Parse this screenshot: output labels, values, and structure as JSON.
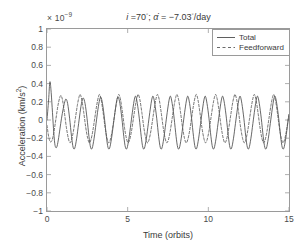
{
  "figure": {
    "exponent_prefix": "× 10",
    "exponent_power": "−9",
    "title_inclination": "i",
    "title_eq1": " =70",
    "title_deg1": "◦",
    "title_sep": "; ",
    "title_alpha": "α̇",
    "title_eq2": " = −7.03",
    "title_deg2": "◦",
    "title_unit": "/day",
    "title_full": "i =70°; α̇ = −7.03°/day"
  },
  "legend": {
    "position": "top-right",
    "items": [
      {
        "label": "Total",
        "style": "solid",
        "color": "#4d4d4d"
      },
      {
        "label": "Feedforward",
        "style": "dashed",
        "color": "#5a5a5a"
      }
    ]
  },
  "chart_data": {
    "type": "line",
    "xlabel": "Time (orbits)",
    "ylabel": "Acceleration (km/s²)",
    "y_exponent": -9,
    "xlim": [
      0,
      15
    ],
    "ylim": [
      -1,
      1
    ],
    "xticks": [
      0,
      5,
      10,
      15
    ],
    "yticks": [
      1,
      0.8,
      0.6,
      0.4,
      0.2,
      0,
      -0.2,
      -0.4,
      -0.6,
      -0.8,
      -1
    ],
    "xticklabels": [
      "0",
      "5",
      "10",
      "15"
    ],
    "yticklabels": [
      "1",
      "0.8",
      "0.6",
      "0.4",
      "0.2",
      "0",
      "−0.2",
      "−0.4",
      "−0.6",
      "−0.8",
      "−1"
    ],
    "grid": false,
    "series": [
      {
        "name": "Total",
        "style": "solid",
        "color": "#4d4d4d",
        "description": "Oscillatory acceleration, one cycle per orbit, initial peak 0.42e-9 decaying to steady amplitude of about 0.25e-9, slight positive-negative asymmetry",
        "period_orbits": 1.0,
        "initial_peak": 0.42,
        "steady_peak": 0.26,
        "steady_trough": -0.3,
        "points": [
          [
            0.0,
            0.0
          ],
          [
            0.1,
            0.22
          ],
          [
            0.18,
            0.42
          ],
          [
            0.26,
            0.3
          ],
          [
            0.34,
            0.08
          ],
          [
            0.42,
            -0.14
          ],
          [
            0.5,
            -0.28
          ],
          [
            0.6,
            -0.3
          ],
          [
            0.7,
            -0.22
          ],
          [
            0.8,
            -0.1
          ],
          [
            0.9,
            0.02
          ],
          [
            1.0,
            0.12
          ],
          [
            1.1,
            0.2
          ],
          [
            1.18,
            0.23
          ],
          [
            1.28,
            0.18
          ],
          [
            1.4,
            0.02
          ],
          [
            1.52,
            -0.18
          ],
          [
            1.62,
            -0.3
          ],
          [
            1.72,
            -0.31
          ],
          [
            1.84,
            -0.2
          ],
          [
            1.96,
            -0.04
          ],
          [
            2.08,
            0.12
          ],
          [
            2.18,
            0.22
          ],
          [
            2.26,
            0.24
          ],
          [
            2.36,
            0.18
          ],
          [
            2.48,
            0.02
          ],
          [
            2.6,
            -0.18
          ],
          [
            2.7,
            -0.3
          ],
          [
            2.8,
            -0.31
          ],
          [
            2.92,
            -0.2
          ],
          [
            3.04,
            -0.04
          ],
          [
            3.16,
            0.12
          ],
          [
            3.26,
            0.22
          ],
          [
            3.34,
            0.25
          ],
          [
            3.44,
            0.18
          ],
          [
            3.56,
            0.02
          ],
          [
            3.68,
            -0.18
          ],
          [
            3.78,
            -0.3
          ],
          [
            3.88,
            -0.31
          ],
          [
            4.0,
            -0.2
          ],
          [
            4.12,
            -0.04
          ],
          [
            4.24,
            0.12
          ],
          [
            4.34,
            0.23
          ],
          [
            4.42,
            0.25
          ],
          [
            4.52,
            0.18
          ],
          [
            4.64,
            0.02
          ],
          [
            4.76,
            -0.18
          ],
          [
            4.86,
            -0.3
          ],
          [
            4.96,
            -0.31
          ],
          [
            5.08,
            -0.2
          ],
          [
            5.2,
            -0.04
          ],
          [
            5.32,
            0.12
          ],
          [
            5.42,
            0.23
          ],
          [
            5.5,
            0.26
          ],
          [
            5.6,
            0.18
          ],
          [
            5.72,
            0.02
          ],
          [
            5.84,
            -0.18
          ],
          [
            5.94,
            -0.3
          ],
          [
            6.04,
            -0.31
          ],
          [
            6.16,
            -0.2
          ],
          [
            6.28,
            -0.04
          ],
          [
            6.4,
            0.12
          ],
          [
            6.5,
            0.23
          ],
          [
            6.58,
            0.26
          ],
          [
            6.68,
            0.18
          ],
          [
            6.8,
            0.02
          ],
          [
            6.92,
            -0.18
          ],
          [
            7.02,
            -0.3
          ],
          [
            7.12,
            -0.31
          ],
          [
            7.24,
            -0.2
          ],
          [
            7.36,
            -0.04
          ],
          [
            7.48,
            0.12
          ],
          [
            7.58,
            0.23
          ],
          [
            7.66,
            0.26
          ],
          [
            7.76,
            0.18
          ],
          [
            7.88,
            0.02
          ],
          [
            8.0,
            -0.18
          ],
          [
            8.1,
            -0.3
          ],
          [
            8.2,
            -0.31
          ],
          [
            8.32,
            -0.2
          ],
          [
            8.44,
            -0.04
          ],
          [
            8.56,
            0.12
          ],
          [
            8.66,
            0.23
          ],
          [
            8.74,
            0.26
          ],
          [
            8.84,
            0.18
          ],
          [
            8.96,
            0.02
          ],
          [
            9.08,
            -0.18
          ],
          [
            9.18,
            -0.3
          ],
          [
            9.28,
            -0.31
          ],
          [
            9.4,
            -0.2
          ],
          [
            9.52,
            -0.04
          ],
          [
            9.64,
            0.12
          ],
          [
            9.74,
            0.23
          ],
          [
            9.82,
            0.26
          ],
          [
            9.92,
            0.18
          ],
          [
            10.04,
            0.02
          ],
          [
            10.16,
            -0.18
          ],
          [
            10.26,
            -0.3
          ],
          [
            10.36,
            -0.31
          ],
          [
            10.48,
            -0.2
          ],
          [
            10.6,
            -0.04
          ],
          [
            10.72,
            0.12
          ],
          [
            10.82,
            0.23
          ],
          [
            10.9,
            0.26
          ],
          [
            11.0,
            0.18
          ],
          [
            11.12,
            0.02
          ],
          [
            11.24,
            -0.18
          ],
          [
            11.34,
            -0.3
          ],
          [
            11.44,
            -0.31
          ],
          [
            11.56,
            -0.2
          ],
          [
            11.68,
            -0.04
          ],
          [
            11.8,
            0.12
          ],
          [
            11.9,
            0.23
          ],
          [
            11.98,
            0.26
          ],
          [
            12.08,
            0.18
          ],
          [
            12.2,
            0.02
          ],
          [
            12.32,
            -0.18
          ],
          [
            12.42,
            -0.3
          ],
          [
            12.52,
            -0.31
          ],
          [
            12.64,
            -0.2
          ],
          [
            12.76,
            -0.04
          ],
          [
            12.88,
            0.12
          ],
          [
            12.98,
            0.23
          ],
          [
            13.06,
            0.26
          ],
          [
            13.16,
            0.18
          ],
          [
            13.28,
            0.02
          ],
          [
            13.4,
            -0.18
          ],
          [
            13.5,
            -0.3
          ],
          [
            13.6,
            -0.31
          ],
          [
            13.72,
            -0.2
          ],
          [
            13.84,
            -0.04
          ],
          [
            13.96,
            0.12
          ],
          [
            14.06,
            0.23
          ],
          [
            14.14,
            0.26
          ],
          [
            14.24,
            0.18
          ],
          [
            14.36,
            0.02
          ],
          [
            14.48,
            -0.18
          ],
          [
            14.58,
            -0.3
          ],
          [
            14.68,
            -0.31
          ],
          [
            14.8,
            -0.2
          ],
          [
            14.92,
            -0.04
          ],
          [
            15.0,
            0.06
          ]
        ]
      },
      {
        "name": "Feedforward",
        "style": "dashed",
        "color": "#5a5a5a",
        "description": "Same one-cycle-per-orbit oscillation as Total but without the initial transient; steady amplitude about 0.27e-9 peak and -0.25e-9 trough, slightly phase-shifted ahead of Total",
        "period_orbits": 1.0,
        "steady_peak": 0.28,
        "steady_trough": -0.26,
        "points": [
          [
            0.0,
            -0.06
          ],
          [
            0.1,
            -0.18
          ],
          [
            0.2,
            -0.24
          ],
          [
            0.32,
            -0.22
          ],
          [
            0.44,
            -0.12
          ],
          [
            0.56,
            0.02
          ],
          [
            0.68,
            0.16
          ],
          [
            0.78,
            0.24
          ],
          [
            0.86,
            0.27
          ],
          [
            0.96,
            0.22
          ],
          [
            1.08,
            0.08
          ],
          [
            1.2,
            -0.08
          ],
          [
            1.32,
            -0.2
          ],
          [
            1.42,
            -0.25
          ],
          [
            1.52,
            -0.22
          ],
          [
            1.64,
            -0.12
          ],
          [
            1.76,
            0.02
          ],
          [
            1.88,
            0.16
          ],
          [
            1.98,
            0.25
          ],
          [
            2.06,
            0.28
          ],
          [
            2.16,
            0.22
          ],
          [
            2.28,
            0.08
          ],
          [
            2.4,
            -0.08
          ],
          [
            2.52,
            -0.2
          ],
          [
            2.62,
            -0.25
          ],
          [
            2.72,
            -0.22
          ],
          [
            2.84,
            -0.12
          ],
          [
            2.96,
            0.02
          ],
          [
            3.08,
            0.16
          ],
          [
            3.18,
            0.25
          ],
          [
            3.26,
            0.28
          ],
          [
            3.36,
            0.22
          ],
          [
            3.48,
            0.08
          ],
          [
            3.6,
            -0.08
          ],
          [
            3.72,
            -0.2
          ],
          [
            3.82,
            -0.25
          ],
          [
            3.92,
            -0.22
          ],
          [
            4.04,
            -0.12
          ],
          [
            4.16,
            0.02
          ],
          [
            4.28,
            0.16
          ],
          [
            4.38,
            0.25
          ],
          [
            4.46,
            0.28
          ],
          [
            4.56,
            0.22
          ],
          [
            4.68,
            0.08
          ],
          [
            4.8,
            -0.08
          ],
          [
            4.92,
            -0.2
          ],
          [
            5.02,
            -0.25
          ],
          [
            5.12,
            -0.22
          ],
          [
            5.24,
            -0.12
          ],
          [
            5.36,
            0.02
          ],
          [
            5.48,
            0.16
          ],
          [
            5.58,
            0.25
          ],
          [
            5.66,
            0.28
          ],
          [
            5.76,
            0.22
          ],
          [
            5.88,
            0.08
          ],
          [
            6.0,
            -0.08
          ],
          [
            6.12,
            -0.2
          ],
          [
            6.22,
            -0.25
          ],
          [
            6.32,
            -0.22
          ],
          [
            6.44,
            -0.12
          ],
          [
            6.56,
            0.02
          ],
          [
            6.68,
            0.16
          ],
          [
            6.78,
            0.25
          ],
          [
            6.86,
            0.28
          ],
          [
            6.96,
            0.22
          ],
          [
            7.08,
            0.08
          ],
          [
            7.2,
            -0.08
          ],
          [
            7.32,
            -0.2
          ],
          [
            7.42,
            -0.25
          ],
          [
            7.52,
            -0.22
          ],
          [
            7.64,
            -0.12
          ],
          [
            7.76,
            0.02
          ],
          [
            7.88,
            0.16
          ],
          [
            7.98,
            0.25
          ],
          [
            8.06,
            0.28
          ],
          [
            8.16,
            0.22
          ],
          [
            8.28,
            0.08
          ],
          [
            8.4,
            -0.08
          ],
          [
            8.52,
            -0.2
          ],
          [
            8.62,
            -0.25
          ],
          [
            8.72,
            -0.22
          ],
          [
            8.84,
            -0.12
          ],
          [
            8.96,
            0.02
          ],
          [
            9.08,
            0.16
          ],
          [
            9.18,
            0.25
          ],
          [
            9.26,
            0.28
          ],
          [
            9.36,
            0.22
          ],
          [
            9.48,
            0.08
          ],
          [
            9.6,
            -0.08
          ],
          [
            9.72,
            -0.2
          ],
          [
            9.82,
            -0.25
          ],
          [
            9.92,
            -0.22
          ],
          [
            10.04,
            -0.12
          ],
          [
            10.16,
            0.02
          ],
          [
            10.28,
            0.16
          ],
          [
            10.38,
            0.25
          ],
          [
            10.46,
            0.28
          ],
          [
            10.56,
            0.22
          ],
          [
            10.68,
            0.08
          ],
          [
            10.8,
            -0.08
          ],
          [
            10.92,
            -0.2
          ],
          [
            11.02,
            -0.25
          ],
          [
            11.12,
            -0.22
          ],
          [
            11.24,
            -0.12
          ],
          [
            11.36,
            0.02
          ],
          [
            11.48,
            0.16
          ],
          [
            11.58,
            0.25
          ],
          [
            11.66,
            0.28
          ],
          [
            11.76,
            0.22
          ],
          [
            11.88,
            0.08
          ],
          [
            12.0,
            -0.08
          ],
          [
            12.12,
            -0.2
          ],
          [
            12.22,
            -0.25
          ],
          [
            12.32,
            -0.22
          ],
          [
            12.44,
            -0.12
          ],
          [
            12.56,
            0.02
          ],
          [
            12.68,
            0.16
          ],
          [
            12.78,
            0.25
          ],
          [
            12.86,
            0.28
          ],
          [
            12.96,
            0.22
          ],
          [
            13.08,
            0.08
          ],
          [
            13.2,
            -0.08
          ],
          [
            13.32,
            -0.2
          ],
          [
            13.42,
            -0.25
          ],
          [
            13.52,
            -0.22
          ],
          [
            13.64,
            -0.12
          ],
          [
            13.76,
            0.02
          ],
          [
            13.88,
            0.16
          ],
          [
            13.98,
            0.25
          ],
          [
            14.06,
            0.28
          ],
          [
            14.16,
            0.22
          ],
          [
            14.28,
            0.08
          ],
          [
            14.4,
            -0.08
          ],
          [
            14.52,
            -0.2
          ],
          [
            14.62,
            -0.25
          ],
          [
            14.72,
            -0.22
          ],
          [
            14.84,
            -0.12
          ],
          [
            14.96,
            0.02
          ],
          [
            15.0,
            0.06
          ]
        ]
      }
    ]
  }
}
